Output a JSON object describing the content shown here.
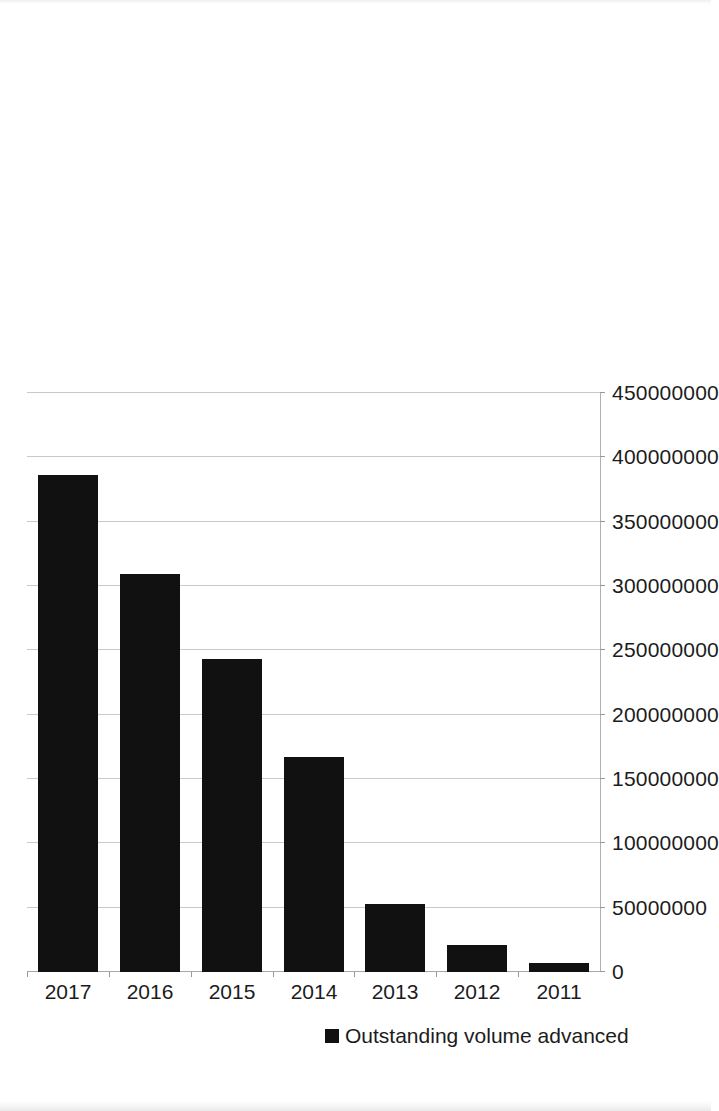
{
  "chart_data": {
    "type": "bar",
    "orientation": "vertical-printed-sideways",
    "title": "",
    "subtitle": "",
    "xlabel": "",
    "ylabel": "",
    "categories": [
      "2011",
      "2012",
      "2013",
      "2014",
      "2015",
      "2016",
      "2017"
    ],
    "series": [
      {
        "name": "Outstanding volume advanced",
        "color": "#111111",
        "values": [
          7000000,
          21000000,
          53000000,
          167000000,
          243000000,
          309000000,
          386000000
        ]
      }
    ],
    "ylim": [
      0,
      450000000
    ],
    "y_ticks": [
      0,
      50000000,
      100000000,
      150000000,
      200000000,
      250000000,
      300000000,
      350000000,
      400000000,
      450000000
    ],
    "y_tick_labels": [
      "0",
      "50000000",
      "100000000",
      "150000000",
      "200000000",
      "250000000",
      "300000000",
      "350000000",
      "400000000",
      "450000000"
    ],
    "grid": true,
    "grid_axis": "value",
    "legend_position": "right",
    "legend_entries": [
      "Outstanding volume advanced"
    ]
  },
  "legend": {
    "entry_label": "Outstanding volume advanced",
    "swatch_color": "#111111",
    "marker_icon": "filled-square-marker"
  },
  "axes": {
    "value_axis_labels": [
      "450000000",
      "400000000",
      "350000000",
      "300000000",
      "250000000",
      "200000000",
      "150000000",
      "100000000",
      "50000000",
      "0"
    ],
    "category_axis_labels": [
      "2017",
      "2016",
      "2015",
      "2014",
      "2013",
      "2012",
      "2011"
    ]
  }
}
